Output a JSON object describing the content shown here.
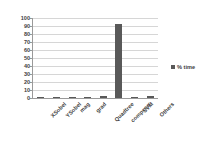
{
  "chart_data": {
    "type": "bar",
    "title": "",
    "xlabel": "",
    "ylabel": "",
    "ylim": [
      0,
      100
    ],
    "ytick_step": 10,
    "yticks": [
      0,
      10,
      20,
      30,
      40,
      50,
      60,
      70,
      80,
      90,
      100
    ],
    "grid": true,
    "legend_position": "right",
    "categories": [
      "XSobel",
      "YSobel",
      "mag",
      "grad",
      "Quadtree",
      "compcorr",
      "SVM",
      "Others"
    ],
    "series": [
      {
        "name": "% time",
        "values": [
          1,
          1,
          1,
          1,
          3,
          92,
          1,
          3
        ],
        "color": "#595959"
      }
    ]
  },
  "legend": {
    "entries": [
      {
        "label": "% time",
        "marker": "square-marker",
        "color": "#595959"
      }
    ]
  },
  "colors": {
    "bar": "#595959",
    "grid": "#d6d6d6",
    "axis": "#9a9a9a",
    "text": "#404040",
    "background": "#ffffff"
  }
}
